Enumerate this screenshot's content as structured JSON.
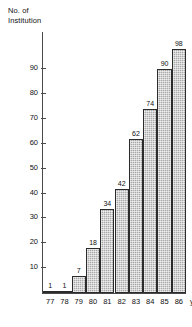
{
  "chart_data": {
    "type": "bar",
    "title": "",
    "ylabel": "No. of\nInstitution",
    "xlabel": "year",
    "categories": [
      "77",
      "78",
      "79",
      "80",
      "81",
      "82",
      "83",
      "84",
      "85",
      "86"
    ],
    "values": [
      1,
      1,
      7,
      18,
      34,
      42,
      62,
      74,
      90,
      98
    ],
    "data_labels": [
      "1",
      "1",
      "7",
      "18",
      "34",
      "42",
      "62",
      "74",
      "90",
      "98"
    ],
    "ylim": [
      0,
      105
    ],
    "y_ticks": [
      10,
      20,
      30,
      40,
      50,
      60,
      70,
      80,
      90
    ],
    "y_tick_labels": [
      "10",
      "20",
      "30",
      "40",
      "50",
      "60",
      "70",
      "80",
      "90"
    ],
    "grid": false,
    "legend": null,
    "bar_fill_color": "#a8a8a8",
    "bar_border_color": "#2b2b2b",
    "axis_color": "#4a4a4a",
    "text_color": "#111111"
  }
}
